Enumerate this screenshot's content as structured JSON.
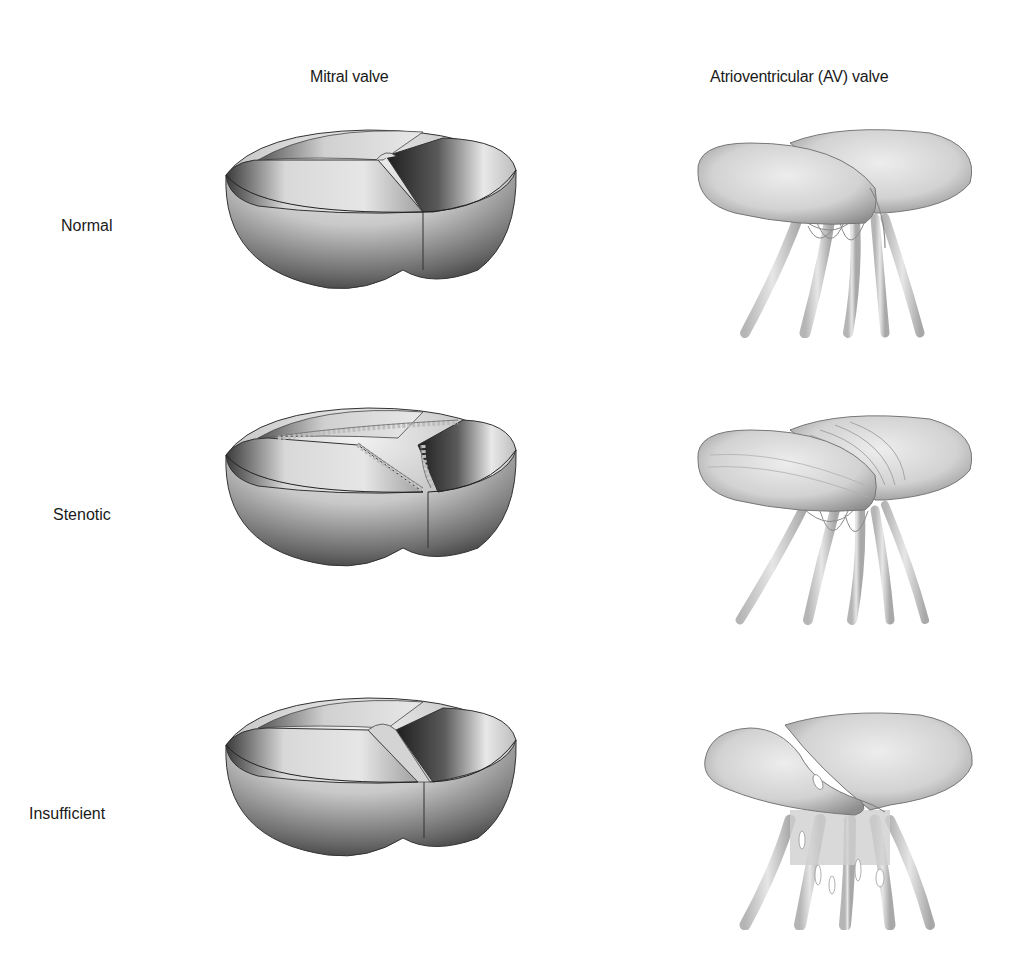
{
  "figure": {
    "columns": [
      {
        "id": "mitral",
        "label": "Mitral valve"
      },
      {
        "id": "av",
        "label": "Atrioventricular (AV) valve"
      }
    ],
    "rows": [
      {
        "id": "normal",
        "label": "Normal"
      },
      {
        "id": "stenotic",
        "label": "Stenotic"
      },
      {
        "id": "insufficient",
        "label": "Insufficient"
      }
    ],
    "panels": [
      {
        "row": "normal",
        "column": "mitral",
        "depiction": "three-cusp bowl-shaped valve, cusps closed with clean straight commissures"
      },
      {
        "row": "normal",
        "column": "av",
        "depiction": "two leaflets closed, attached to chordae tendineae strands"
      },
      {
        "row": "stenotic",
        "column": "mitral",
        "depiction": "three-cusp valve with thickened, nodular, fused commissure edges"
      },
      {
        "row": "stenotic",
        "column": "av",
        "depiction": "two thickened, ridged leaflets with chordae tendineae"
      },
      {
        "row": "insufficient",
        "column": "mitral",
        "depiction": "three-cusp valve with cusps not fully coapting, gap at center"
      },
      {
        "row": "insufficient",
        "column": "av",
        "depiction": "leaflets curled upward leaving opening, with chordae tendineae"
      }
    ],
    "colors": {
      "background": "#ffffff",
      "text": "#1a1a1a",
      "illustration_dark": "#3a3a3a",
      "illustration_mid": "#9a9a9a",
      "illustration_light": "#eeeeee"
    }
  }
}
